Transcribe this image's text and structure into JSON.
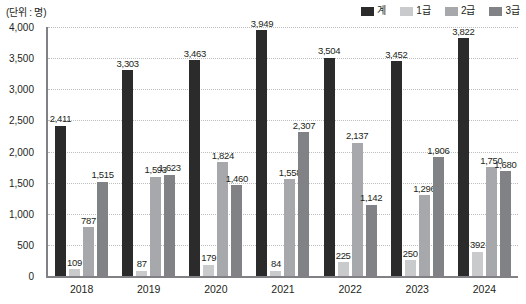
{
  "unit_label": "(단위 : 명)",
  "legend": {
    "items": [
      {
        "label": "계",
        "color": "#2b2b2b"
      },
      {
        "label": "1급",
        "color": "#c9cacc"
      },
      {
        "label": "2급",
        "color": "#a6a8ab"
      },
      {
        "label": "3급",
        "color": "#808285"
      }
    ]
  },
  "chart_data": {
    "type": "bar",
    "title": "",
    "subtitle": "",
    "xlabel": "",
    "ylabel": "",
    "unit": "(단위 : 명)",
    "ylim": [
      0,
      4000
    ],
    "ytick_step": 500,
    "ytick_labels": [
      "0",
      "500",
      "1,000",
      "1,500",
      "2,000",
      "2,500",
      "3,000",
      "3,500",
      "4,000"
    ],
    "ytick_values": [
      0,
      500,
      1000,
      1500,
      2000,
      2500,
      3000,
      3500,
      4000
    ],
    "grid": true,
    "grid_style": "dotted",
    "legend_position": "top-right",
    "categories": [
      "2018",
      "2019",
      "2020",
      "2021",
      "2022",
      "2023",
      "2024"
    ],
    "series": [
      {
        "name": "계",
        "color": "#2b2b2b",
        "values": [
          2411,
          3303,
          3463,
          3949,
          3504,
          3452,
          3822
        ],
        "labels": [
          "2,411",
          "3,303",
          "3,463",
          "3,949",
          "3,504",
          "3,452",
          "3,822"
        ]
      },
      {
        "name": "1급",
        "color": "#c9cacc",
        "values": [
          109,
          87,
          179,
          84,
          225,
          250,
          392
        ],
        "labels": [
          "109",
          "87",
          "179",
          "84",
          "225",
          "250",
          "392"
        ]
      },
      {
        "name": "2급",
        "color": "#a6a8ab",
        "values": [
          787,
          1593,
          1824,
          1558,
          2137,
          1296,
          1750
        ],
        "labels": [
          "787",
          "1,593",
          "1,824",
          "1,558",
          "2,137",
          "1,296",
          "1,750"
        ]
      },
      {
        "name": "3급",
        "color": "#808285",
        "values": [
          1515,
          1623,
          1460,
          2307,
          1142,
          1906,
          1680
        ],
        "labels": [
          "1,515",
          "1,623",
          "1,460",
          "2,307",
          "1,142",
          "1,906",
          "1,680"
        ]
      }
    ]
  }
}
